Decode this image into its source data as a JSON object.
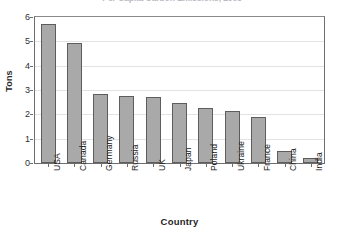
{
  "chart_data": {
    "type": "bar",
    "title": "Per Capita Carbon Emissions, 2005",
    "xlabel": "Country",
    "ylabel": "Tons",
    "categories": [
      "USA",
      "Canada",
      "Germany",
      "Russia",
      "UK",
      "Japan",
      "Poland",
      "Ukraine",
      "France",
      "China",
      "India"
    ],
    "values": [
      5.7,
      4.95,
      2.85,
      2.75,
      2.7,
      2.45,
      2.25,
      2.15,
      1.9,
      0.5,
      0.2
    ],
    "ylim": [
      0,
      6
    ],
    "yticks": [
      "0",
      "1",
      "2",
      "3",
      "4",
      "5",
      "6"
    ],
    "ytick_values": [
      0,
      1,
      2,
      3,
      4,
      5,
      6
    ],
    "grid": true,
    "legend": "none",
    "bar_color": "#a9a9a9",
    "bar_border_color": "#5d5d5d",
    "gridline_color": "#e3e3e3",
    "axis_color": "#6e6e6e"
  }
}
